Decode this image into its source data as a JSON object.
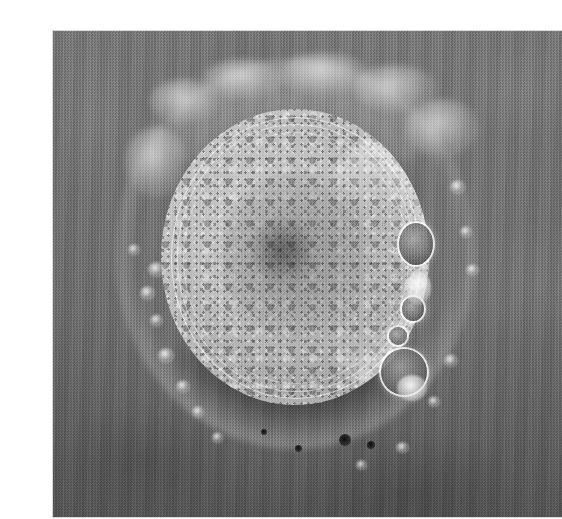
{
  "image": {
    "kind": "photomicrograph",
    "subject": "mammalian oocyte with surrounding cumulus/corona radiata cells",
    "modality": "phase-contrast light microscopy",
    "color_mode": "grayscale",
    "caption": "",
    "alt_text": "Grayscale phase-contrast micrograph of a rounded oocyte with granular cytoplasm, a dark zona pellucida ring, bright perivitelline vesicles on the right side, and scattered small corona cells around the periphery"
  },
  "canvas": {
    "width_px": 535,
    "height_px": 519,
    "page_background": "#ffffff"
  },
  "plate": {
    "x_px": 13,
    "y_px": 15,
    "width_px": 509,
    "height_px": 486,
    "background_gray": "#6b6b6b",
    "border_color": "#d8d8d8"
  },
  "palette": {
    "background_field": "#6b6b6b",
    "field_light": "#757575",
    "field_dark": "#545454",
    "zona_dark": "#232323",
    "ooplasm_light": "#cfcfcf",
    "ooplasm_mid": "#ababab",
    "ooplasm_dark": "#8b8b8b",
    "highlight_white": "#ffffff",
    "vesicle_dark": "#4a4a4a"
  },
  "structures": {
    "oocyte": {
      "label": "oocyte",
      "center_x_px": 242,
      "center_y_px": 226,
      "radius_x_px": 134,
      "radius_y_px": 148
    },
    "zona_pellucida": {
      "label": "zona pellucida",
      "center_x_px": 242,
      "center_y_px": 227,
      "radius_x_px": 150,
      "radius_y_px": 165,
      "thickness_px": 16
    },
    "cytoplasm_core": {
      "label": "central granular zone",
      "center_x_px": 243,
      "center_y_px": 225,
      "radius_x_px": 75,
      "radius_y_px": 85
    },
    "membrane_rings": [
      {
        "label": "inner ring 1",
        "left_px": 10,
        "top_px": 8,
        "width_px": 248,
        "height_px": 280
      },
      {
        "label": "inner ring 2",
        "left_px": 16,
        "top_px": 15,
        "width_px": 236,
        "height_px": 266
      },
      {
        "label": "inner ring 3",
        "left_px": 22,
        "top_px": 23,
        "width_px": 224,
        "height_px": 250
      }
    ],
    "vesicles": [
      {
        "label": "upper right vesicle",
        "left_px": 246,
        "top_px": 112,
        "size_px": 34
      },
      {
        "label": "mid right vesicle",
        "left_px": 249,
        "top_px": 186,
        "size_px": 22
      },
      {
        "label": "lower right vesicle",
        "left_px": 228,
        "top_px": 238,
        "size_px": 44
      },
      {
        "label": "small right vesicle",
        "left_px": 236,
        "top_px": 216,
        "size_px": 18
      }
    ],
    "dark_dots": [
      {
        "left_px": 186,
        "top_px": 318,
        "size_px": 11
      },
      {
        "left_px": 214,
        "top_px": 326,
        "size_px": 7
      },
      {
        "left_px": 142,
        "top_px": 332,
        "size_px": 6
      }
    ],
    "corona_cells_left": [
      {
        "left_px": 96,
        "top_px": 232,
        "size_px": 14
      },
      {
        "left_px": 90,
        "top_px": 258,
        "size_px": 12
      },
      {
        "left_px": 100,
        "top_px": 286,
        "size_px": 10
      },
      {
        "left_px": 108,
        "top_px": 320,
        "size_px": 13
      },
      {
        "left_px": 124,
        "top_px": 352,
        "size_px": 11
      },
      {
        "left_px": 140,
        "top_px": 378,
        "size_px": 9
      }
    ],
    "corona_cells_right": [
      {
        "left_px": 398,
        "top_px": 152,
        "size_px": 12
      },
      {
        "left_px": 406,
        "top_px": 198,
        "size_px": 9
      },
      {
        "left_px": 412,
        "top_px": 236,
        "size_px": 10
      },
      {
        "left_px": 392,
        "top_px": 326,
        "size_px": 11
      },
      {
        "left_px": 378,
        "top_px": 368,
        "size_px": 9
      }
    ]
  },
  "annotations": {
    "scale_bar": null,
    "labels": [],
    "text_overlays": []
  }
}
